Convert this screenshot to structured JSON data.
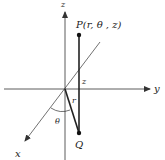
{
  "diagram": {
    "type": "cylindrical-coordinates",
    "axes": {
      "z_label": "z",
      "y_label": "y",
      "x_label": "x"
    },
    "point_label": "P(r, θ , z)",
    "projection_label": "Q",
    "segment_labels": {
      "height": "z",
      "radius": "r",
      "angle": "θ"
    },
    "colors": {
      "line": "#222222",
      "axis": "#333333",
      "background": "#ffffff"
    }
  }
}
